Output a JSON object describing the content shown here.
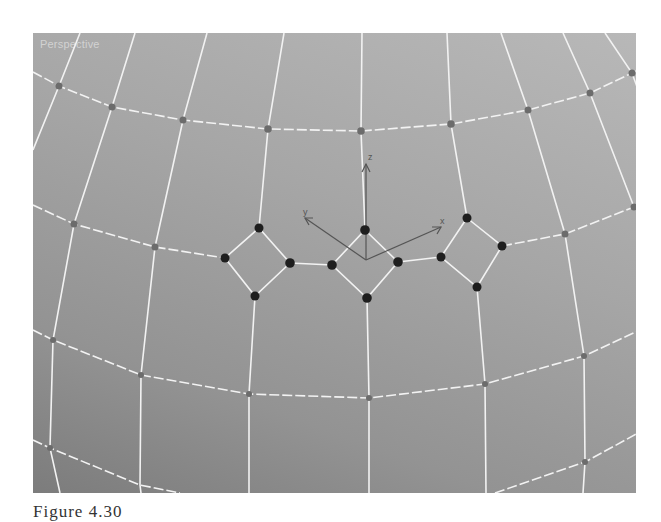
{
  "viewport": {
    "label": "Perspective",
    "background_top": "#b8b8b8",
    "background_bottom": "#7c7c7c"
  },
  "gizmo": {
    "origin": [
      366,
      260
    ],
    "axes": [
      {
        "name": "X",
        "label": "x",
        "end": [
          441,
          227
        ],
        "label_pos": [
          442,
          222
        ]
      },
      {
        "name": "Y",
        "label": "y",
        "end": [
          305,
          218
        ],
        "label_pos": [
          306,
          212
        ]
      },
      {
        "name": "Z",
        "label": "z",
        "end": [
          366,
          164
        ],
        "label_pos": [
          370,
          157
        ]
      }
    ],
    "color": "#555555"
  },
  "mesh": {
    "line_color": "#f4f4f4",
    "vertex_color": "#6a6a6a",
    "selected_vertex_color": "#1e1e1e"
  },
  "selected_quads": [
    {
      "name": "left",
      "vertices": [
        [
          259,
          228
        ],
        [
          290,
          263
        ],
        [
          255,
          296
        ],
        [
          225,
          258
        ]
      ]
    },
    {
      "name": "center",
      "vertices": [
        [
          365,
          230
        ],
        [
          398,
          262
        ],
        [
          367,
          298
        ],
        [
          332,
          265
        ]
      ]
    },
    {
      "name": "right",
      "vertices": [
        [
          467,
          218
        ],
        [
          502,
          246
        ],
        [
          477,
          287
        ],
        [
          441,
          257
        ]
      ]
    }
  ],
  "caption": "Figure 4.30"
}
